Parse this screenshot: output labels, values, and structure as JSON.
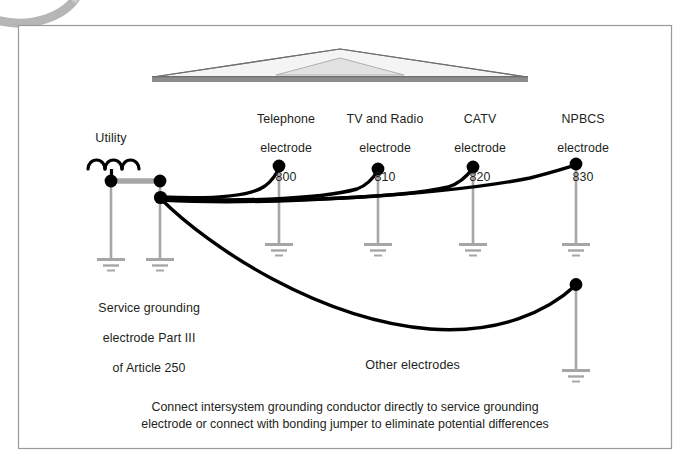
{
  "figure": {
    "border_color": "#9a9a9a",
    "background_color": "#ffffff",
    "conductor_color": "#000000",
    "electrode_riser_color": "#a6a6a6",
    "ground_symbol_color": "#a6a6a6",
    "roof_fill_color": "#f2f2f2",
    "roof_outline_color": "#808080",
    "roof_base_color": "#8c8c8c",
    "corner_arc_color": "#b3b3b3"
  },
  "utility": {
    "label": "Utility"
  },
  "service": {
    "lines": [
      "Service grounding",
      "electrode Part III",
      "of Article 250"
    ]
  },
  "electrodes": [
    {
      "name": "telephone",
      "line1": "Telephone",
      "line2": "electrode",
      "number": "800"
    },
    {
      "name": "tv-and-radio",
      "line1": "TV and Radio",
      "line2": "electrode",
      "number": "810"
    },
    {
      "name": "catv",
      "line1": "CATV",
      "line2": "electrode",
      "number": "820"
    },
    {
      "name": "npbcs",
      "line1": "NPBCS",
      "line2": "electrode",
      "number": "830"
    }
  ],
  "other_electrodes": {
    "label": "Other electrodes"
  },
  "caption": {
    "line1": "Connect intersystem grounding conductor directly to service grounding",
    "line2": "electrode or connect with bonding jumper to eliminate potential differences"
  },
  "footer": {
    "note": ""
  }
}
